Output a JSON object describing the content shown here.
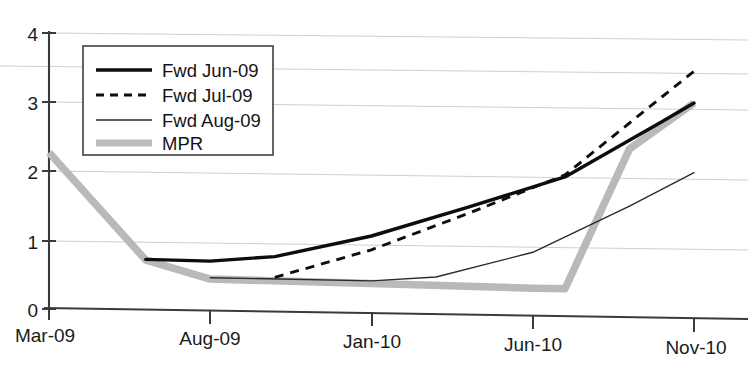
{
  "chart_data": {
    "type": "line",
    "title": "",
    "xlabel": "",
    "ylabel": "",
    "ylim": [
      0,
      4
    ],
    "yticks": [
      0,
      1,
      2,
      3,
      4
    ],
    "ytick_labels": [
      "0",
      "1",
      "2",
      "3",
      "4"
    ],
    "grid": true,
    "gridlines_y": [
      1,
      2,
      3,
      3.5,
      4
    ],
    "xtick_labels": [
      "Mar-09",
      "Aug-09",
      "Jan-10",
      "Jun-10",
      "Nov-10"
    ],
    "x_months": [
      "Mar-09",
      "Aug-09",
      "Jan-10",
      "Jun-10",
      "Nov-10"
    ],
    "legend_position": "upper-left-inside",
    "series": [
      {
        "name": "Fwd Jun-09",
        "style": "thick-solid-black",
        "color": "#0d0d0d",
        "x": [
          "Jun-09",
          "Aug-09",
          "Oct-09",
          "Jan-10",
          "Apr-10",
          "Jul-10",
          "Oct-10",
          "Nov-10"
        ],
        "values": [
          0.74,
          0.73,
          0.81,
          1.13,
          1.57,
          2.03,
          2.85,
          3.13
        ]
      },
      {
        "name": "Fwd Jul-09",
        "style": "dashed-black",
        "color": "#0d0d0d",
        "x": [
          "Oct-09",
          "Jan-10",
          "Apr-10",
          "Jul-10",
          "Oct-10",
          "Nov-10"
        ],
        "values": [
          0.51,
          0.93,
          1.48,
          2.06,
          3.21,
          3.59
        ]
      },
      {
        "name": "Fwd Aug-09",
        "style": "thin-solid-black",
        "color": "#2a2a2a",
        "x": [
          "Aug-09",
          "Jan-10",
          "Mar-10",
          "Jun-10",
          "Sep-10",
          "Nov-10"
        ],
        "values": [
          0.49,
          0.48,
          0.55,
          0.93,
          1.62,
          2.12
        ]
      },
      {
        "name": "MPR",
        "style": "thick-gray",
        "color": "#b9b9b9",
        "x": [
          "Mar-09",
          "Jun-09",
          "Aug-09",
          "Jan-10",
          "Jun-10",
          "Jul-10",
          "Sep-10",
          "Nov-10"
        ],
        "values": [
          2.27,
          0.73,
          0.47,
          0.44,
          0.41,
          0.41,
          2.45,
          3.13
        ]
      }
    ]
  },
  "legend": {
    "entries": [
      {
        "label": "Fwd Jun-09",
        "icon": "thick-solid-line-icon"
      },
      {
        "label": "Fwd Jul-09",
        "icon": "dashed-line-icon"
      },
      {
        "label": "Fwd Aug-09",
        "icon": "thin-solid-line-icon"
      },
      {
        "label": "MPR",
        "icon": "thick-gray-line-icon"
      }
    ]
  },
  "axes": {
    "y_labels": [
      "4",
      "3",
      "2",
      "1",
      "0"
    ],
    "x_labels": [
      "Mar-09",
      "Aug-09",
      "Jan-10",
      "Jun-10",
      "Nov-10"
    ]
  },
  "colors": {
    "series_black": "#0d0d0d",
    "series_gray": "#b9b9b9",
    "grid": "#c9c9c9",
    "axis": "#3a3a3a",
    "background": "#ffffff"
  }
}
